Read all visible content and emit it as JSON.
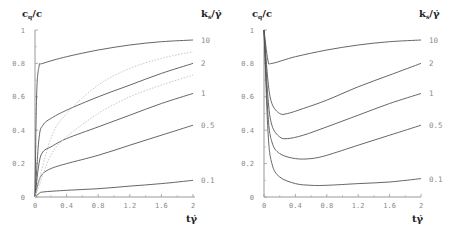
{
  "chart_data": [
    {
      "type": "line",
      "title": "",
      "ylabel": "c_q/c",
      "xlabel": "tγ̇",
      "legend_title": "k_s/γ̇",
      "xlim": [
        0,
        2
      ],
      "ylim": [
        0,
        1
      ],
      "xticks": [
        "0",
        "0.4",
        "0.8",
        "1.2",
        "1.6",
        "2"
      ],
      "yticks": [
        "0",
        "0.2",
        "0.4",
        "0.6",
        "0.8",
        "1"
      ],
      "series": [
        {
          "name": "10",
          "style": "solid",
          "x": [
            0,
            0.02,
            0.05,
            0.1,
            0.4,
            0.8,
            1.2,
            1.6,
            2
          ],
          "values": [
            0,
            0.6,
            0.78,
            0.8,
            0.84,
            0.88,
            0.91,
            0.93,
            0.94
          ]
        },
        {
          "name": "2",
          "style": "solid",
          "x": [
            0,
            0.05,
            0.1,
            0.2,
            0.4,
            0.8,
            1.2,
            1.6,
            2
          ],
          "values": [
            0,
            0.35,
            0.43,
            0.47,
            0.52,
            0.6,
            0.67,
            0.74,
            0.8
          ]
        },
        {
          "name": "1",
          "style": "solid",
          "x": [
            0,
            0.05,
            0.1,
            0.2,
            0.4,
            0.8,
            1.2,
            1.6,
            2
          ],
          "values": [
            0,
            0.2,
            0.27,
            0.3,
            0.35,
            0.42,
            0.49,
            0.56,
            0.62
          ]
        },
        {
          "name": "0.5",
          "style": "solid",
          "x": [
            0,
            0.05,
            0.1,
            0.2,
            0.4,
            0.8,
            1.2,
            1.6,
            2
          ],
          "values": [
            0,
            0.1,
            0.14,
            0.17,
            0.2,
            0.25,
            0.31,
            0.37,
            0.43
          ]
        },
        {
          "name": "0.1",
          "style": "solid",
          "x": [
            0,
            0.05,
            0.1,
            0.4,
            0.8,
            1.2,
            1.6,
            2
          ],
          "values": [
            0,
            0.02,
            0.03,
            0.04,
            0.05,
            0.065,
            0.08,
            0.1
          ]
        },
        {
          "name": "dotted-upper",
          "style": "dotted",
          "x": [
            0,
            0.2,
            0.4,
            0.8,
            1.2,
            1.6,
            2
          ],
          "values": [
            0,
            0.35,
            0.5,
            0.67,
            0.77,
            0.83,
            0.87
          ]
        },
        {
          "name": "dotted-lower",
          "style": "dotted",
          "x": [
            0,
            0.2,
            0.4,
            0.8,
            1.2,
            1.6,
            2
          ],
          "values": [
            0,
            0.25,
            0.36,
            0.5,
            0.6,
            0.67,
            0.73
          ]
        }
      ]
    },
    {
      "type": "line",
      "title": "",
      "ylabel": "c_q/c",
      "xlabel": "tγ̇",
      "legend_title": "k_s/γ̇",
      "xlim": [
        0,
        2
      ],
      "ylim": [
        0,
        1
      ],
      "xticks": [
        "0",
        "0.4",
        "0.8",
        "1.2",
        "1.6",
        "2"
      ],
      "yticks": [
        "0",
        "0.2",
        "0.4",
        "0.6",
        "0.8",
        "1"
      ],
      "series": [
        {
          "name": "10",
          "style": "solid",
          "x": [
            0,
            0.05,
            0.1,
            0.4,
            0.8,
            1.2,
            1.6,
            2
          ],
          "values": [
            1,
            0.82,
            0.8,
            0.84,
            0.88,
            0.91,
            0.93,
            0.94
          ]
        },
        {
          "name": "2",
          "style": "solid",
          "x": [
            0,
            0.05,
            0.1,
            0.2,
            0.3,
            0.5,
            0.8,
            1.2,
            1.6,
            2
          ],
          "values": [
            1,
            0.7,
            0.56,
            0.5,
            0.5,
            0.53,
            0.58,
            0.66,
            0.73,
            0.8
          ]
        },
        {
          "name": "1",
          "style": "solid",
          "x": [
            0,
            0.05,
            0.1,
            0.2,
            0.3,
            0.5,
            0.8,
            1.2,
            1.6,
            2
          ],
          "values": [
            1,
            0.6,
            0.43,
            0.36,
            0.35,
            0.37,
            0.42,
            0.49,
            0.56,
            0.62
          ]
        },
        {
          "name": "0.5",
          "style": "solid",
          "x": [
            0,
            0.05,
            0.1,
            0.2,
            0.4,
            0.6,
            0.8,
            1.2,
            1.6,
            2
          ],
          "values": [
            1,
            0.5,
            0.33,
            0.26,
            0.23,
            0.23,
            0.25,
            0.31,
            0.37,
            0.43
          ]
        },
        {
          "name": "0.1",
          "style": "solid",
          "x": [
            0,
            0.05,
            0.1,
            0.2,
            0.4,
            0.6,
            0.8,
            1.2,
            1.6,
            2
          ],
          "values": [
            1,
            0.4,
            0.2,
            0.12,
            0.08,
            0.07,
            0.07,
            0.08,
            0.09,
            0.11
          ]
        }
      ]
    }
  ],
  "left": {
    "ylabel_main": "c",
    "ylabel_sub": "q",
    "ylabel_tail": "/c",
    "legend_main": "k",
    "legend_sub": "s",
    "legend_tail": "/γ̇",
    "xlabel": "tγ̇",
    "xticks": [
      "0",
      "0.4",
      "0.8",
      "1.2",
      "1.6",
      "2"
    ],
    "yticks": [
      "0",
      "0.2",
      "0.4",
      "0.6",
      "0.8",
      "1"
    ],
    "curve_labels": [
      "10",
      "2",
      "1",
      "0.5",
      "0.1"
    ]
  },
  "right": {
    "ylabel_main": "c",
    "ylabel_sub": "q",
    "ylabel_tail": "/c",
    "legend_main": "k",
    "legend_sub": "s",
    "legend_tail": "/γ̇",
    "xlabel": "tγ̇",
    "xticks": [
      "0",
      "0.4",
      "0.8",
      "1.2",
      "1.6",
      "2"
    ],
    "yticks": [
      "0",
      "0.2",
      "0.4",
      "0.6",
      "0.8",
      "1"
    ],
    "curve_labels": [
      "10",
      "2",
      "1",
      "0.5",
      "0.1"
    ]
  }
}
